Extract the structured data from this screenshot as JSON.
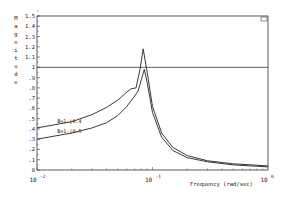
{
  "chart_data": {
    "type": "line",
    "title": "",
    "xlabel": "Frequency (rad/sec)",
    "ylabel": "Magnitude",
    "xscale": "log",
    "xlim": [
      0.01,
      1.0
    ],
    "ylim": [
      0,
      1.5
    ],
    "x_ticks": [
      "10^-2",
      "10^-1",
      "10^0"
    ],
    "y_ticks": [
      "0",
      ".1",
      ".2",
      ".3",
      ".4",
      ".5",
      ".6",
      ".7",
      ".8",
      ".9",
      "1",
      "1.1",
      "1.2",
      "1.3",
      "1.4",
      "1.5"
    ],
    "reference_line": {
      "y": 1.0
    },
    "corner_marker": "box",
    "series": [
      {
        "name": "B=1-j0.4",
        "x": [
          0.01,
          0.02,
          0.03,
          0.04,
          0.05,
          0.06,
          0.065,
          0.072,
          0.078,
          0.083,
          0.09,
          0.1,
          0.12,
          0.15,
          0.2,
          0.3,
          0.5,
          1.0
        ],
        "values": [
          0.41,
          0.47,
          0.54,
          0.61,
          0.68,
          0.76,
          0.79,
          0.8,
          0.98,
          1.18,
          0.95,
          0.62,
          0.36,
          0.22,
          0.14,
          0.09,
          0.06,
          0.04
        ]
      },
      {
        "name": "B=1-j0.5",
        "x": [
          0.01,
          0.02,
          0.03,
          0.04,
          0.05,
          0.06,
          0.07,
          0.075,
          0.08,
          0.085,
          0.09,
          0.1,
          0.12,
          0.15,
          0.2,
          0.3,
          0.5,
          1.0
        ],
        "values": [
          0.3,
          0.36,
          0.41,
          0.46,
          0.53,
          0.62,
          0.72,
          0.77,
          0.88,
          0.98,
          0.85,
          0.56,
          0.32,
          0.19,
          0.12,
          0.08,
          0.05,
          0.03
        ]
      }
    ],
    "annotations": [
      {
        "text": "B=1-j0.4",
        "x": 0.015,
        "y": 0.46
      },
      {
        "text": "B=1-j0.5",
        "x": 0.015,
        "y": 0.36
      }
    ]
  }
}
